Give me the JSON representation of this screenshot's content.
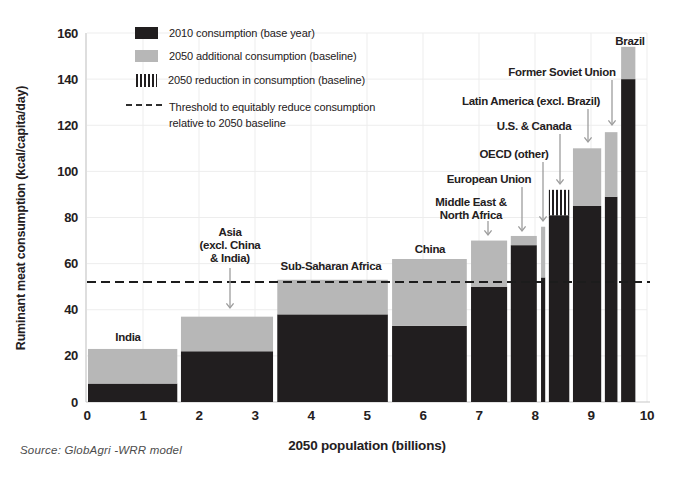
{
  "figure": {
    "legend": {
      "items": [
        {
          "swatch": "black-square",
          "label": "2010 consumption (base year)"
        },
        {
          "swatch": "gray-square",
          "label": "2050 additional consumption (baseline)"
        },
        {
          "swatch": "vertical-hatch-square",
          "label": "2050 reduction in consumption (baseline)"
        },
        {
          "swatch": "dashed-line",
          "label": "Threshold to equitably reduce consumption relative to 2050 baseline"
        }
      ]
    },
    "source": "Source: GlobAgri -WRR model"
  },
  "chart_data": {
    "type": "bar",
    "variant": "variable-width stacked bars (Marimekko)",
    "title": "",
    "xlabel": "2050 population (billions)",
    "ylabel": "Ruminant meat consumption (kcal/capita/day)",
    "xlim": [
      0,
      10
    ],
    "ylim": [
      0,
      160
    ],
    "x_ticks": [
      0,
      1,
      2,
      3,
      4,
      5,
      6,
      7,
      8,
      9,
      10
    ],
    "y_ticks": [
      0,
      20,
      40,
      60,
      80,
      100,
      120,
      140,
      160
    ],
    "grid": true,
    "legend_position": "top-left",
    "threshold": {
      "value": 52,
      "label": "Threshold to equitably reduce consumption relative to 2050 baseline"
    },
    "series_labels": {
      "base": "2010 consumption (base year)",
      "additional": "2050 additional consumption (baseline)",
      "reduction": "2050 reduction in consumption (baseline)"
    },
    "regions": [
      {
        "name": "India",
        "label_lines": [
          "India"
        ],
        "pop_start": 0.0,
        "pop_end": 1.63,
        "consumption_2010": 8,
        "consumption_2050_baseline": 23,
        "reduction": false
      },
      {
        "name": "Asia (excl. China & India)",
        "label_lines": [
          "Asia",
          "(excl. China",
          "& India)"
        ],
        "pop_start": 1.66,
        "pop_end": 3.34,
        "consumption_2010": 22,
        "consumption_2050_baseline": 37,
        "reduction": false
      },
      {
        "name": "Sub-Saharan Africa",
        "label_lines": [
          "Sub-Saharan Africa"
        ],
        "pop_start": 3.38,
        "pop_end": 5.39,
        "consumption_2010": 38,
        "consumption_2050_baseline": 53,
        "reduction": false
      },
      {
        "name": "China",
        "label_lines": [
          "China"
        ],
        "pop_start": 5.43,
        "pop_end": 6.8,
        "consumption_2010": 33,
        "consumption_2050_baseline": 62,
        "reduction": false
      },
      {
        "name": "Middle East & North Africa",
        "label_lines": [
          "Middle East &",
          "North Africa"
        ],
        "pop_start": 6.84,
        "pop_end": 7.52,
        "consumption_2010": 50,
        "consumption_2050_baseline": 70,
        "reduction": false
      },
      {
        "name": "European Union",
        "label_lines": [
          "European Union"
        ],
        "pop_start": 7.55,
        "pop_end": 8.05,
        "consumption_2010": 68,
        "consumption_2050_baseline": 72,
        "reduction": false
      },
      {
        "name": "OECD (other)",
        "label_lines": [
          "OECD (other)"
        ],
        "pop_start": 8.09,
        "pop_end": 8.2,
        "consumption_2010": 54,
        "consumption_2050_baseline": 76,
        "reduction": false
      },
      {
        "name": "U.S. & Canada",
        "label_lines": [
          "U.S. & Canada"
        ],
        "pop_start": 8.23,
        "pop_end": 8.63,
        "consumption_2010": 92,
        "consumption_2050_baseline": 81,
        "reduction": true
      },
      {
        "name": "Latin America (excl. Brazil)",
        "label_lines": [
          "Latin America (excl. Brazil)"
        ],
        "pop_start": 8.66,
        "pop_end": 9.2,
        "consumption_2010": 85,
        "consumption_2050_baseline": 110,
        "reduction": false
      },
      {
        "name": "Former Soviet Union",
        "label_lines": [
          "Former Soviet Union"
        ],
        "pop_start": 9.23,
        "pop_end": 9.49,
        "consumption_2010": 89,
        "consumption_2050_baseline": 117,
        "reduction": false
      },
      {
        "name": "Brazil",
        "label_lines": [
          "Brazil"
        ],
        "pop_start": 9.52,
        "pop_end": 9.81,
        "consumption_2010": 140,
        "consumption_2050_baseline": 154,
        "reduction": false
      }
    ],
    "colors": {
      "base": "#211e1f",
      "additional": "#b7b7b7",
      "reduction_hatch": "#211e1f",
      "threshold_line": "#1c1c1c",
      "gridline": "#ededed",
      "axis_line": "#c8c8c8",
      "arrow": "#9d9d9d",
      "text": "#242021"
    }
  }
}
